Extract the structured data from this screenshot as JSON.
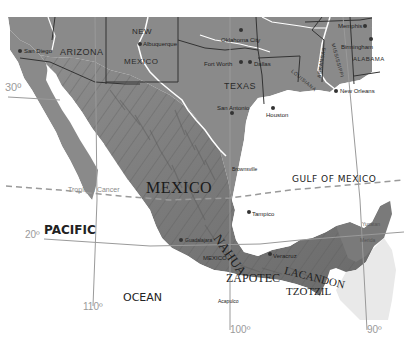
{
  "map": {
    "title": "Mexico and surrounding region",
    "colors": {
      "land": "#8c8c8c",
      "land_dark": "#6e6e6e",
      "water": "#ffffff",
      "rivers": "#ffffff",
      "grid": "#9a9a9a"
    },
    "states": {
      "arizona": "ARIZONA",
      "new": "NEW",
      "mexico_nm": "MEXICO",
      "texas": "TEXAS",
      "louisiana": "LOUISIANA",
      "arkansas": "ARKANSAS",
      "mississippi": "MISSISSIPPI",
      "alabama": "ALABAMA"
    },
    "country": "MEXICO",
    "water_bodies": {
      "gulf": "GULF OF MEXICO",
      "pacific": "PACIFIC",
      "ocean": "OCEAN"
    },
    "cities": {
      "san_diego": "San Diego",
      "albuquerque": "Albuquerque",
      "oklahoma_city": "Oklahoma City",
      "memphis": "Memphis",
      "birmingham": "Birmingham",
      "fort_worth": "Fort Worth",
      "dallas": "Dallas",
      "san_antonio": "San Antonio",
      "houston": "Houston",
      "new_orleans": "New Orleans",
      "brownsville": "Brownsville",
      "tampico": "Tampico",
      "guadalajara": "Guadalajara",
      "mexico_city": "MEXICO",
      "veracruz": "Veracruz",
      "acapulco": "Acapulco",
      "yucatan": "Yucatan",
      "merida": "Merida"
    },
    "peoples": {
      "nahua": "NAHUA",
      "zapotec": "ZAPOTEC",
      "lacandon": "LACANDON",
      "tzotzil": "TZOTZIL"
    },
    "lines": {
      "tropic": "Tropic of Cancer",
      "lat30": "30º",
      "lat20": "20º",
      "lon110": "110º",
      "lon100": "100º",
      "lon90": "90º"
    }
  }
}
